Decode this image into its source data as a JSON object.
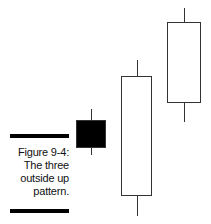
{
  "caption": {
    "figure_label": "Figure 9-4:",
    "lines": [
      "The three",
      "outside up",
      "pattern."
    ]
  },
  "chart_data": {
    "type": "candlestick",
    "figure_label": "Figure 9-4",
    "xlabel": "",
    "ylabel": "",
    "axes": "none",
    "grid": false,
    "legend": null,
    "candles": [
      {
        "index": 1,
        "color": "black",
        "direction": "down",
        "high": 109,
        "open": 120,
        "close": 148,
        "low": 155,
        "x_left": 76,
        "x_right": 106
      },
      {
        "index": 2,
        "color": "white",
        "direction": "up",
        "high": 60,
        "open": 196,
        "close": 76,
        "low": 216,
        "x_left": 121,
        "x_right": 152
      },
      {
        "index": 3,
        "color": "white",
        "direction": "up",
        "high": 8,
        "open": 103,
        "close": 22,
        "low": 122,
        "x_left": 167,
        "x_right": 201
      }
    ],
    "note": "Values are pixel y-coordinates (smaller = higher price); no price axis shown."
  }
}
